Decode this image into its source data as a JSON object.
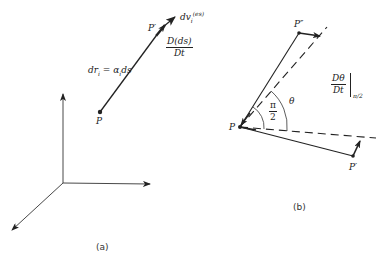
{
  "figure_a": {
    "caption": "(a)",
    "point_p": "P",
    "point_p_prime": "P′",
    "element_label": "dr",
    "element_sub": "i",
    "element_eq": " = α",
    "element_eq_sub": "i",
    "element_tail": "ds",
    "velocity_label": "dv",
    "velocity_sub": "i",
    "velocity_sup": "(es)",
    "rate_num": "D(ds)",
    "rate_den": "Dt"
  },
  "figure_b": {
    "caption": "(b)",
    "point_p": "P",
    "point_p_double_prime": "P″",
    "point_p_prime": "P′",
    "angle_right_num": "π",
    "angle_right_den": "2",
    "angle_theta": "θ",
    "rate_num": "Dθ",
    "rate_den": "Dt",
    "rate_eval": "π/2"
  },
  "colors": {
    "ink": "#222222",
    "background": "#ffffff"
  }
}
